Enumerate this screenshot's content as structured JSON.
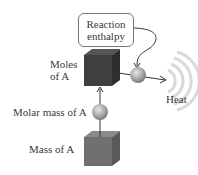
{
  "diagram": {
    "reaction_box": {
      "line1": "Reaction",
      "line2": "enthalpy"
    },
    "moles_label": {
      "line1": "Moles",
      "line2": "of A"
    },
    "molar_mass_label": "Molar mass of A",
    "mass_label": "Mass of A",
    "heat_label": "Heat"
  },
  "colors": {
    "moles_cube": "#3d3d3d",
    "mass_cube": "#6e6e6e",
    "sphere": "#a8a8a8",
    "heat_waves": "#d8d8d8"
  }
}
